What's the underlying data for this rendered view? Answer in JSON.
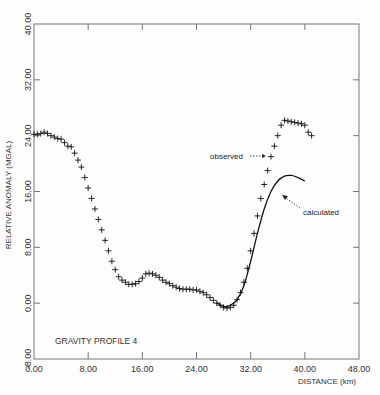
{
  "chart_data": {
    "type": "scatter",
    "title": "GRAVITY PROFILE 4",
    "xlabel": "DISTANCE (km)",
    "ylabel": "RELATIVE ANOMALY (MGAL)",
    "xlim": [
      0,
      48
    ],
    "ylim": [
      -8,
      40
    ],
    "x_ticks": [
      "0.00",
      "8.00",
      "16.00",
      "24.00",
      "32.00",
      "40.00",
      "48.00"
    ],
    "y_ticks": [
      "-8.00",
      "0.00",
      "8.00",
      "16.00",
      "24.00",
      "32.00",
      "40.00"
    ],
    "grid": false,
    "series": [
      {
        "name": "observed",
        "marker": "+",
        "x": [
          0,
          0.5,
          1,
          1.5,
          2,
          2.5,
          3,
          3.5,
          4,
          4.5,
          5,
          5.5,
          6,
          6.5,
          7,
          7.5,
          8,
          8.5,
          9,
          9.5,
          10,
          10.5,
          11,
          11.5,
          12,
          12.5,
          13,
          13.5,
          14,
          14.5,
          15,
          15.5,
          16,
          16.5,
          17,
          17.5,
          18,
          18.5,
          19,
          19.5,
          20,
          20.5,
          21,
          21.5,
          22,
          22.5,
          23,
          23.5,
          24,
          24.5,
          25,
          25.5,
          26,
          26.5,
          27,
          27.5,
          28,
          28.5,
          29,
          29.5,
          30,
          30.5,
          31,
          31.5,
          32,
          32.5,
          33,
          33.5,
          34,
          34.5,
          35,
          35.5,
          36,
          36.5,
          37,
          37.5,
          38,
          38.5,
          39,
          39.5,
          40,
          40.5,
          41
        ],
        "y": [
          24.2,
          24.2,
          24.3,
          24.5,
          24.3,
          24.0,
          23.8,
          23.6,
          23.5,
          23.0,
          22.5,
          22.4,
          21.5,
          20.5,
          19.5,
          18.0,
          16.5,
          15.0,
          13.5,
          12.0,
          10.5,
          9.0,
          7.5,
          6.0,
          4.8,
          3.8,
          3.3,
          3.0,
          2.7,
          2.7,
          2.8,
          3.1,
          3.6,
          4.2,
          4.3,
          4.2,
          4.0,
          3.7,
          3.3,
          3.0,
          2.8,
          2.5,
          2.3,
          2.1,
          2.0,
          2.0,
          2.0,
          1.9,
          1.9,
          1.7,
          1.5,
          1.2,
          0.8,
          0.4,
          0.0,
          -0.3,
          -0.6,
          -0.7,
          -0.6,
          -0.3,
          0.5,
          1.5,
          3.0,
          5.0,
          7.5,
          10.0,
          12.5,
          15.0,
          17.0,
          19.0,
          21.0,
          22.5,
          24.0,
          25.5,
          26.2,
          26.1,
          26.0,
          25.9,
          25.8,
          25.7,
          25.5,
          24.5,
          24.0
        ]
      },
      {
        "name": "calculated",
        "marker": "line",
        "x": [
          27,
          28,
          29,
          30,
          31,
          32,
          33,
          34,
          35,
          36,
          37,
          38,
          39,
          40
        ],
        "y": [
          0.1,
          -0.5,
          -0.3,
          0.5,
          2.5,
          6.0,
          10.0,
          13.5,
          16.0,
          17.5,
          18.2,
          18.3,
          18.0,
          17.5
        ]
      }
    ],
    "annotations": [
      {
        "text": "observed",
        "arrow_to": [
          33.8,
          18.5
        ]
      },
      {
        "text": "calculated",
        "arrow_to": [
          36.5,
          17.2
        ]
      },
      {
        "text": "GRAVITY PROFILE 4",
        "position": "bottom-left"
      }
    ]
  },
  "labels": {
    "title": "GRAVITY PROFILE 4",
    "xlabel": "DISTANCE (km)",
    "ylabel": "RELATIVE ANOMALY (MGAL)",
    "observed": "observed",
    "calculated": "calculated"
  }
}
